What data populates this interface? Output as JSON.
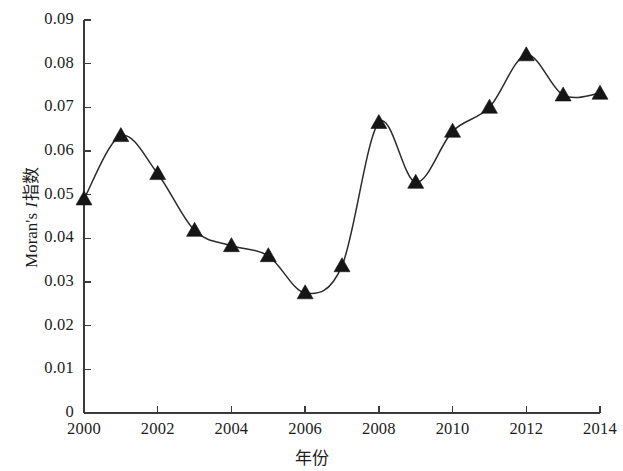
{
  "chart_data": {
    "type": "line",
    "title": "",
    "subtitle": "",
    "xlabel": "年份",
    "ylabel_prefix": "Moran's ",
    "ylabel_italic": "I",
    "ylabel_suffix": "指数",
    "ylabel_full": "Moran's I指数",
    "x": [
      2000,
      2001,
      2002,
      2003,
      2004,
      2005,
      2006,
      2007,
      2008,
      2009,
      2010,
      2011,
      2012,
      2013,
      2014
    ],
    "values": [
      0.049,
      0.0635,
      0.0548,
      0.0418,
      0.0383,
      0.036,
      0.0275,
      0.0337,
      0.0665,
      0.0528,
      0.0645,
      0.07,
      0.082,
      0.0728,
      0.0732
    ],
    "series": [
      {
        "name": "Moran's I指数",
        "values": [
          0.049,
          0.0635,
          0.0548,
          0.0418,
          0.0383,
          0.036,
          0.0275,
          0.0337,
          0.0665,
          0.0528,
          0.0645,
          0.07,
          0.082,
          0.0728,
          0.0732
        ]
      }
    ],
    "xlim": [
      2000,
      2014
    ],
    "ylim": [
      0,
      0.09
    ],
    "xticks": [
      2000,
      2002,
      2004,
      2006,
      2008,
      2010,
      2012,
      2014
    ],
    "xtick_labels": [
      "2000",
      "2002",
      "2004",
      "2006",
      "2008",
      "2010",
      "2012",
      "2014"
    ],
    "yticks": [
      0,
      0.01,
      0.02,
      0.03,
      0.04,
      0.05,
      0.06,
      0.07,
      0.08,
      0.09
    ],
    "ytick_labels": [
      "0",
      "0.01",
      "0.02",
      "0.03",
      "0.04",
      "0.05",
      "0.06",
      "0.07",
      "0.08",
      "0.09"
    ],
    "grid": false,
    "legend": false,
    "legend_position": "none",
    "marker": "triangle",
    "marker_color": "#151515",
    "line_color": "#2b2b2b",
    "background_color": "#ffffff",
    "axis_color": "#3a3a3a",
    "interpolation": "smooth"
  }
}
